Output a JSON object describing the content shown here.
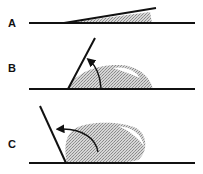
{
  "figure": {
    "panels": [
      {
        "label": "A",
        "contact": "wetting (very small contact angle)"
      },
      {
        "label": "B",
        "contact": "partial wetting (acute contact angle)"
      },
      {
        "label": "C",
        "contact": "non-wetting (obtuse contact angle)"
      }
    ],
    "colors": {
      "line": "#111111",
      "drop": "#bdbdbd",
      "highlight": "#ffffff"
    }
  }
}
